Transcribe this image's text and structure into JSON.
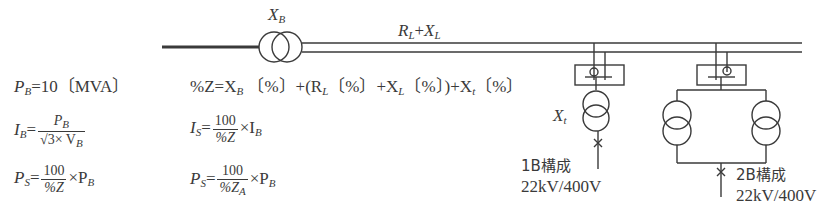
{
  "diagram": {
    "labels": {
      "main_transformer": "X",
      "main_transformer_sub": "B",
      "line_R": "R",
      "line_R_sub": "L",
      "line_plus": "+",
      "line_X": "X",
      "line_X_sub": "L",
      "tx_1b": "X",
      "tx_1b_sub": "t"
    },
    "config_1b": {
      "title": "1B構成",
      "voltage": "22kV/400V"
    },
    "config_2b": {
      "title": "2B構成",
      "voltage": "22kV/400V"
    }
  },
  "formulas": {
    "pb": {
      "lhs": "P",
      "lhs_sub": "B",
      "rhs": "=10〔MVA〕"
    },
    "ib": {
      "lhs": "I",
      "lhs_sub": "B",
      "eq": "=",
      "num": "P",
      "num_sub": "B",
      "den_pre": "√3× V",
      "den_sub": "B"
    },
    "ps1": {
      "lhs": "P",
      "lhs_sub": "S",
      "eq": "=",
      "num": "100",
      "den": "%Z",
      "times": "×P",
      "times_sub": "B"
    },
    "pctz": {
      "text": "%Z=X",
      "sub1": "B",
      "rest1": " 〔%〕+(R",
      "sub2": "L",
      "rest2": "〔%〕+X",
      "sub3": "L",
      "rest3": "〔%〕)+X",
      "sub4": "t",
      "rest4": "〔%〕"
    },
    "is": {
      "lhs": "I",
      "lhs_sub": "S",
      "eq": "=",
      "num": "100",
      "den": "%Z",
      "times": "×I",
      "times_sub": "B"
    },
    "ps2": {
      "lhs": "P",
      "lhs_sub": "S",
      "eq": "=",
      "num": "100",
      "den": "%Z",
      "den_sub": "A",
      "times": "×P",
      "times_sub": "B"
    }
  }
}
